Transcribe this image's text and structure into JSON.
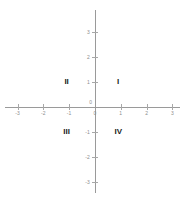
{
  "chart_data": {
    "type": "scatter",
    "title": "",
    "xlabel": "",
    "ylabel": "",
    "xlim": [
      -3.6,
      3.6
    ],
    "ylim": [
      -3.6,
      3.6
    ],
    "grid": false,
    "legend": null,
    "series": [],
    "x_ticks": [
      -3,
      -2,
      -1,
      0,
      1,
      2,
      3
    ],
    "y_ticks": [
      3,
      2,
      1,
      0,
      -1,
      -2,
      -3
    ],
    "x_tick_labels": [
      "-3",
      "-2",
      "-1",
      "0",
      "1",
      "2",
      "3"
    ],
    "y_tick_labels": [
      "3",
      "2",
      "1",
      "0",
      "-1",
      "-2",
      "-3"
    ],
    "annotations": [
      {
        "text": "I",
        "x": 0.9,
        "y": 1.0
      },
      {
        "text": "II",
        "x": -1.1,
        "y": 1.0
      },
      {
        "text": "III",
        "x": -1.1,
        "y": -1.0
      },
      {
        "text": "IV",
        "x": 0.9,
        "y": -1.0
      }
    ],
    "axis_color": "#9a9a9a",
    "tick_label_color": "#8e8e8e",
    "annotation_color": "#1b1b1b",
    "background_color": "#ffffff"
  },
  "axes": {
    "x_axis_name": "x-axis",
    "y_axis_name": "y-axis",
    "origin_label": "0"
  },
  "quadrants": {
    "first": "I",
    "second": "II",
    "third": "III",
    "fourth": "IV"
  }
}
